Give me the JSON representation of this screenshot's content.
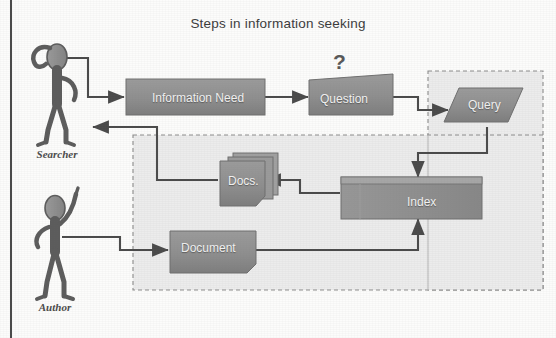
{
  "diagram": {
    "title": "Steps in information seeking",
    "type": "flow-diagram",
    "personas": [
      {
        "id": "searcher",
        "label": "Searcher",
        "pose": "hand-on-head-thinking"
      },
      {
        "id": "author",
        "label": "Author",
        "pose": "arm-raised-pointing"
      }
    ],
    "annotations": [
      {
        "id": "question-mark",
        "text": "?"
      }
    ],
    "regions": [
      {
        "id": "system-region",
        "style": "dashed",
        "label": ""
      },
      {
        "id": "query-region",
        "style": "dashed",
        "label": ""
      }
    ],
    "nodes": [
      {
        "id": "information-need",
        "label": "Information Need",
        "shape": "rectangle"
      },
      {
        "id": "question",
        "label": "Question",
        "shape": "skewed-rectangle"
      },
      {
        "id": "query",
        "label": "Query",
        "shape": "parallelogram"
      },
      {
        "id": "index",
        "label": "Index",
        "shape": "banded-rectangle"
      },
      {
        "id": "docs",
        "label": "Docs.",
        "shape": "document-stack"
      },
      {
        "id": "document",
        "label": "Document",
        "shape": "document"
      }
    ],
    "edges": [
      {
        "from": "searcher",
        "to": "information-need"
      },
      {
        "from": "information-need",
        "to": "question"
      },
      {
        "from": "question",
        "to": "query"
      },
      {
        "from": "query",
        "to": "index"
      },
      {
        "from": "index",
        "to": "docs"
      },
      {
        "from": "docs",
        "to": "searcher"
      },
      {
        "from": "author",
        "to": "document"
      },
      {
        "from": "document",
        "to": "index"
      }
    ],
    "colors": {
      "node_fill": "#8f8f8f",
      "node_fill_light": "#a3a3a3",
      "node_edge": "#6f6f6f",
      "arrow": "#4a4a4a",
      "region_fill": "#ececec",
      "region_stroke": "#8c8c8c",
      "title_text": "#3b3b3b",
      "label_text": "#f2f2f2",
      "persona_fill": "#8e8e8e",
      "persona_stroke": "#5c5c5c",
      "page_rule": "#4a4a4a"
    }
  }
}
